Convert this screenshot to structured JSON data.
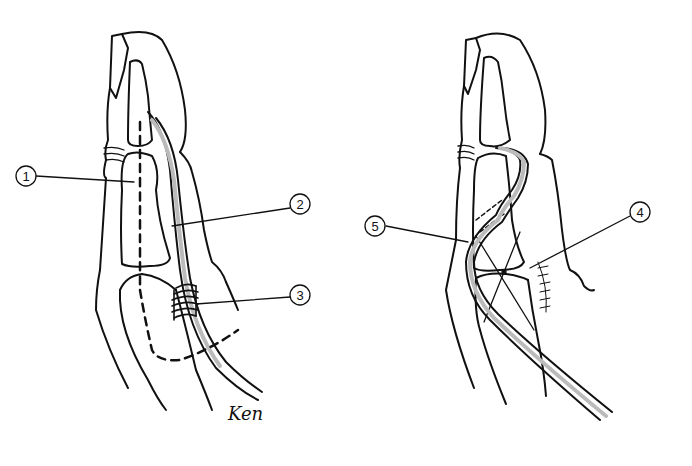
{
  "figure": {
    "type": "anatomical line illustration",
    "panels": [
      {
        "id": "left",
        "description": "Finger (side view) with dashed incision line, tendon/graft and wrapped suture",
        "callouts": [
          {
            "label": "1",
            "x": 26,
            "y": 183
          },
          {
            "label": "2",
            "x": 300,
            "y": 201
          },
          {
            "label": "3",
            "x": 300,
            "y": 292
          }
        ]
      },
      {
        "id": "right",
        "description": "Finger with graft passed through bone tunnel and crossed K-wires at joint",
        "callouts": [
          {
            "label": "4",
            "x": 641,
            "y": 210
          },
          {
            "label": "5",
            "x": 374,
            "y": 225
          }
        ]
      }
    ],
    "signature": "Ken"
  },
  "colors": {
    "line": "#111111",
    "background": "#ffffff",
    "shade": "#bbbbbb"
  }
}
